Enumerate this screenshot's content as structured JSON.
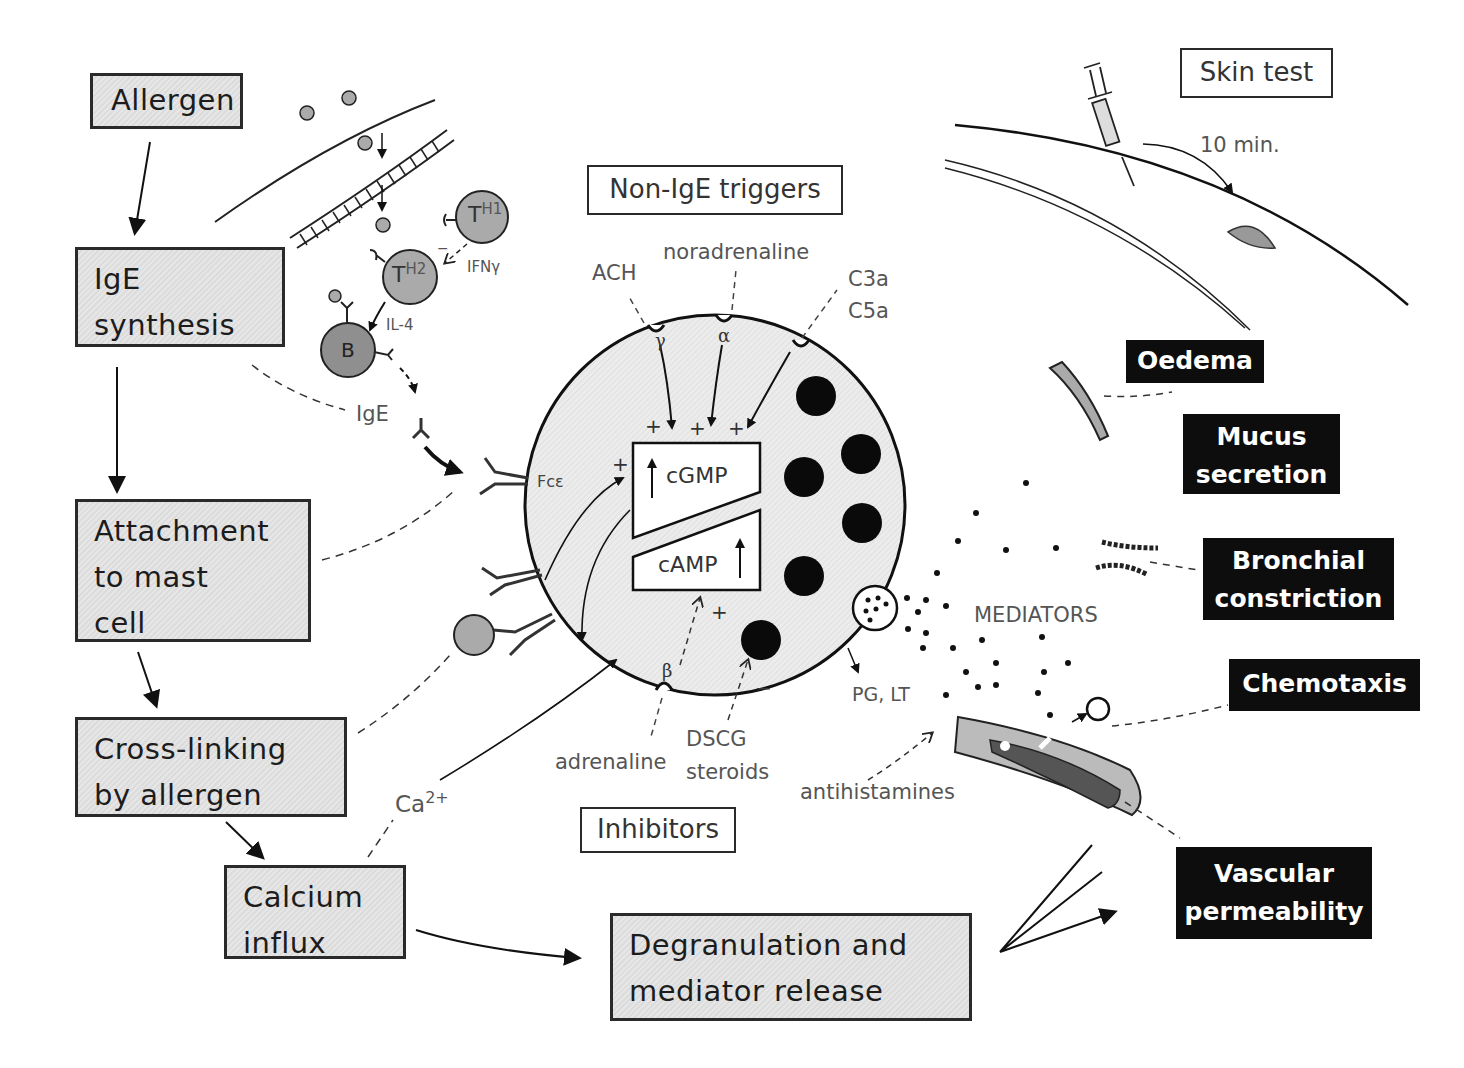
{
  "pathway": {
    "allergen": "Allergen",
    "ige_synthesis": [
      "IgE",
      "synthesis"
    ],
    "attachment": [
      "Attachment",
      "to mast",
      "cell"
    ],
    "cross_linking": [
      "Cross-linking",
      "by allergen"
    ],
    "calcium_influx": [
      "Calcium",
      "influx"
    ],
    "degranulation": [
      "Degranulation and",
      "mediator release"
    ]
  },
  "immune_cells": {
    "th1": "T",
    "th1_sup": "H1",
    "th2": "T",
    "th2_sup": "H2",
    "b_cell": "B",
    "ifn": "IFNγ",
    "il4": "IL-4",
    "ige": "IgE",
    "minus_sign": "−"
  },
  "mast_cell": {
    "receptor_label": "Fcε",
    "cgmp": "cGMP",
    "camp": "cAMP",
    "gamma": "γ",
    "alpha": "α",
    "beta": "β",
    "plus": "+",
    "minus": "−",
    "ca": "Ca",
    "ca_sup": "2+",
    "mediators": "MEDIATORS",
    "pg_lt": "PG, LT"
  },
  "triggers": {
    "title": "Non-IgE triggers",
    "ach": "ACH",
    "noradrenaline": "noradrenaline",
    "c3a": "C3a",
    "c5a": "C5a"
  },
  "inhibitors": {
    "title": "Inhibitors",
    "adrenaline": "adrenaline",
    "dscg": "DSCG",
    "steroids": "steroids",
    "antihistamines": "antihistamines"
  },
  "skin_test": {
    "title": "Skin test",
    "time": "10 min."
  },
  "effects": [
    {
      "label": [
        "Oedema"
      ]
    },
    {
      "label": [
        "Mucus",
        "secretion"
      ]
    },
    {
      "label": [
        "Bronchial",
        "constriction"
      ]
    },
    {
      "label": [
        "Chemotaxis"
      ]
    },
    {
      "label": [
        "Vascular",
        "permeability"
      ]
    }
  ],
  "colors": {
    "box_fill": "#e2e2e2",
    "cell_fill": "#ebebeb",
    "effect_fill": "#0d0d0d",
    "cell_grey": "#a9a9a9",
    "b_cell_grey": "#8f8f8f"
  }
}
